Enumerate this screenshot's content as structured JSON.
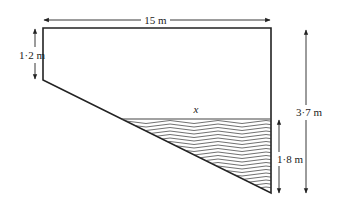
{
  "diagram": {
    "type": "pool-cross-section",
    "labels": {
      "top_width": "15 m",
      "shallow_depth": "1·2 m",
      "deep_depth": "3·7 m",
      "water_depth": "1·8 m",
      "water_surface_width": "x"
    },
    "colors": {
      "line": "#222222",
      "background": "#ffffff"
    }
  }
}
